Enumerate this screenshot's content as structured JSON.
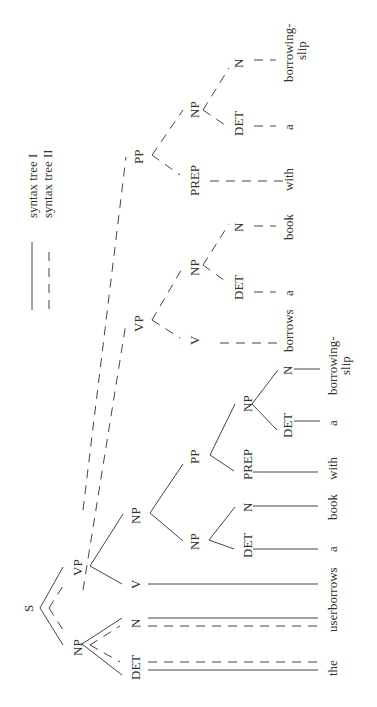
{
  "legend": {
    "items": [
      {
        "style": "solid",
        "label": "syntax tree I"
      },
      {
        "style": "dashed",
        "label": "syntax tree II"
      }
    ]
  },
  "tree1": {
    "nodes": {
      "S": "S",
      "NP": "NP",
      "VP": "VP",
      "DET1": "DET",
      "N1": "N",
      "V": "V",
      "NPobj": "NP",
      "NPinner": "NP",
      "DET2": "DET",
      "N2": "N",
      "PP": "PP",
      "PREP": "PREP",
      "NPpp": "NP",
      "DET3": "DET",
      "N3": "N"
    },
    "words": [
      "the",
      "user",
      "borrows",
      "a",
      "book",
      "with",
      "a",
      "borrowing-",
      "slip"
    ]
  },
  "tree2": {
    "nodes": {
      "VP": "VP",
      "V": "V",
      "NP": "NP",
      "DET": "DET",
      "N": "N",
      "PP": "PP",
      "PREP": "PREP",
      "NPpp": "NP",
      "DET2": "DET",
      "N2": "N"
    },
    "words": [
      "borrows",
      "a",
      "book",
      "with",
      "a",
      "borrowing-",
      "slip"
    ]
  }
}
